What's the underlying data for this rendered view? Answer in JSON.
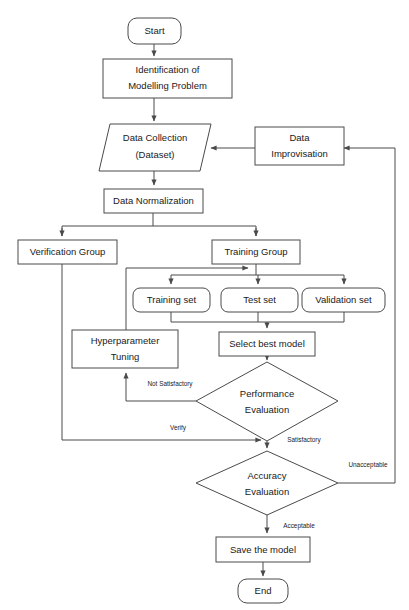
{
  "diagram": {
    "colors": {
      "stroke": "#4a4a4a",
      "fill": "#ffffff",
      "text": "#1a1a1a",
      "background": "#ffffff"
    },
    "nodes": [
      {
        "id": "start",
        "label": "Start",
        "shape": "rounded-terminator"
      },
      {
        "id": "identification",
        "label_line1": "Identification of",
        "label_line2": "Modelling Problem",
        "shape": "rectangle"
      },
      {
        "id": "data_collection",
        "label_line1": "Data Collection",
        "label_line2": "(Dataset)",
        "shape": "parallelogram"
      },
      {
        "id": "data_improvisation",
        "label_line1": "Data",
        "label_line2": "Improvisation",
        "shape": "rectangle"
      },
      {
        "id": "data_normalization",
        "label": "Data Normalization",
        "shape": "rectangle"
      },
      {
        "id": "verification_group",
        "label": "Verification Group",
        "shape": "rectangle"
      },
      {
        "id": "training_group",
        "label": "Training Group",
        "shape": "rectangle"
      },
      {
        "id": "training_set",
        "label": "Training set",
        "shape": "rounded-rectangle"
      },
      {
        "id": "test_set",
        "label": "Test set",
        "shape": "rounded-rectangle"
      },
      {
        "id": "validation_set",
        "label": "Validation set",
        "shape": "rounded-rectangle"
      },
      {
        "id": "hyperparameter_tuning",
        "label_line1": "Hyperparameter",
        "label_line2": "Tuning",
        "shape": "rectangle"
      },
      {
        "id": "select_best_model",
        "label": "Select best model",
        "shape": "rectangle"
      },
      {
        "id": "performance_evaluation",
        "label_line1": "Performance",
        "label_line2": "Evaluation",
        "shape": "diamond"
      },
      {
        "id": "accuracy_evaluation",
        "label_line1": "Accuracy",
        "label_line2": "Evaluation",
        "shape": "diamond"
      },
      {
        "id": "save_the_model",
        "label": "Save the model",
        "shape": "rectangle"
      },
      {
        "id": "end",
        "label": "End",
        "shape": "rounded-terminator"
      }
    ],
    "edge_labels": {
      "not_satisfactory": "Not Satisfactory",
      "verify": "Verify",
      "satisfactory": "Satisfactory",
      "unacceptable": "Unacceptable",
      "acceptable": "Acceptable"
    },
    "node_text": {
      "start": "Start",
      "identification_l1": "Identification of",
      "identification_l2": "Modelling Problem",
      "data_collection_l1": "Data Collection",
      "data_collection_l2": "(Dataset)",
      "data_improvisation_l1": "Data",
      "data_improvisation_l2": "Improvisation",
      "data_normalization": "Data Normalization",
      "verification_group": "Verification Group",
      "training_group": "Training Group",
      "training_set": "Training set",
      "test_set": "Test set",
      "validation_set": "Validation set",
      "hyperparameter_tuning_l1": "Hyperparameter",
      "hyperparameter_tuning_l2": "Tuning",
      "select_best_model": "Select best model",
      "performance_evaluation_l1": "Performance",
      "performance_evaluation_l2": "Evaluation",
      "accuracy_evaluation_l1": "Accuracy",
      "accuracy_evaluation_l2": "Evaluation",
      "save_the_model": "Save the model",
      "end": "End"
    }
  }
}
